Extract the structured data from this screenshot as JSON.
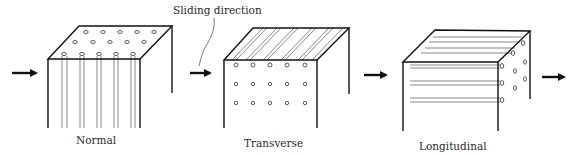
{
  "annotation": {
    "text": "Sliding direction"
  },
  "panels": [
    {
      "id": "normal",
      "label": "Normal"
    },
    {
      "id": "transverse",
      "label": "Transverse"
    },
    {
      "id": "longitudinal",
      "label": "Longitudinal"
    }
  ],
  "arrows": [
    {
      "name": "arrow-1",
      "direction": "right"
    },
    {
      "name": "arrow-2",
      "direction": "right"
    },
    {
      "name": "arrow-3",
      "direction": "right"
    },
    {
      "name": "arrow-4",
      "direction": "right"
    }
  ]
}
